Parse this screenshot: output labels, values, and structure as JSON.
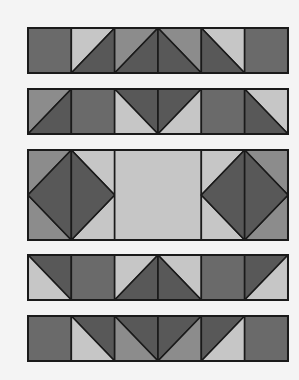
{
  "colors": {
    "background": "#f4f4f4",
    "dark": "#6a6a6a",
    "darkest": "#585858",
    "medium": "#8c8c8c",
    "light": "#c6c6c6",
    "stroke": "#1a1a1a"
  },
  "layout": {
    "left": 28,
    "cell_width": 43.33,
    "columns": 6,
    "stroke_width": 1.6
  },
  "rows": [
    {
      "name": "row-1",
      "top": 28,
      "height": 45,
      "cells": [
        {
          "type": "solid",
          "fill": "dark"
        },
        {
          "type": "hst",
          "diag": "bl-tr",
          "upper": "light",
          "lower": "darkest"
        },
        {
          "type": "hst",
          "diag": "bl-tr",
          "upper": "medium",
          "lower": "darkest"
        },
        {
          "type": "hst",
          "diag": "tl-br",
          "upper": "medium",
          "lower": "darkest"
        },
        {
          "type": "hst",
          "diag": "tl-br",
          "upper": "light",
          "lower": "darkest"
        },
        {
          "type": "solid",
          "fill": "dark"
        }
      ]
    },
    {
      "name": "row-2",
      "top": 89,
      "height": 45,
      "cells": [
        {
          "type": "hst",
          "diag": "bl-tr",
          "upper": "medium",
          "lower": "darkest"
        },
        {
          "type": "solid",
          "fill": "dark"
        },
        {
          "type": "hst",
          "diag": "tl-br",
          "upper": "darkest",
          "lower": "light"
        },
        {
          "type": "hst",
          "diag": "bl-tr",
          "upper": "darkest",
          "lower": "light"
        },
        {
          "type": "solid",
          "fill": "dark"
        },
        {
          "type": "hst",
          "diag": "tl-br",
          "upper": "light",
          "lower": "darkest"
        }
      ]
    },
    {
      "name": "row-3",
      "top": 150,
      "height": 90,
      "blocks": [
        {
          "type": "diamond",
          "span": 2,
          "start": 0,
          "fill": "darkest",
          "corners_left": "medium",
          "corners_right": "light"
        },
        {
          "type": "solid",
          "span": 2,
          "start": 2,
          "fill": "light"
        },
        {
          "type": "diamond",
          "span": 2,
          "start": 4,
          "fill": "darkest",
          "corners_left": "light",
          "corners_right": "medium"
        }
      ]
    },
    {
      "name": "row-4",
      "top": 255,
      "height": 45,
      "cells": [
        {
          "type": "hst",
          "diag": "tl-br",
          "upper": "darkest",
          "lower": "light"
        },
        {
          "type": "solid",
          "fill": "dark"
        },
        {
          "type": "hst",
          "diag": "bl-tr",
          "upper": "light",
          "lower": "darkest"
        },
        {
          "type": "hst",
          "diag": "tl-br",
          "upper": "light",
          "lower": "darkest"
        },
        {
          "type": "solid",
          "fill": "dark"
        },
        {
          "type": "hst",
          "diag": "bl-tr",
          "upper": "darkest",
          "lower": "light"
        }
      ]
    },
    {
      "name": "row-5",
      "top": 316,
      "height": 45,
      "cells": [
        {
          "type": "solid",
          "fill": "dark"
        },
        {
          "type": "hst",
          "diag": "tl-br",
          "upper": "darkest",
          "lower": "light"
        },
        {
          "type": "hst",
          "diag": "tl-br",
          "upper": "darkest",
          "lower": "medium"
        },
        {
          "type": "hst",
          "diag": "bl-tr",
          "upper": "darkest",
          "lower": "medium"
        },
        {
          "type": "hst",
          "diag": "bl-tr",
          "upper": "darkest",
          "lower": "light"
        },
        {
          "type": "solid",
          "fill": "dark"
        }
      ]
    }
  ]
}
